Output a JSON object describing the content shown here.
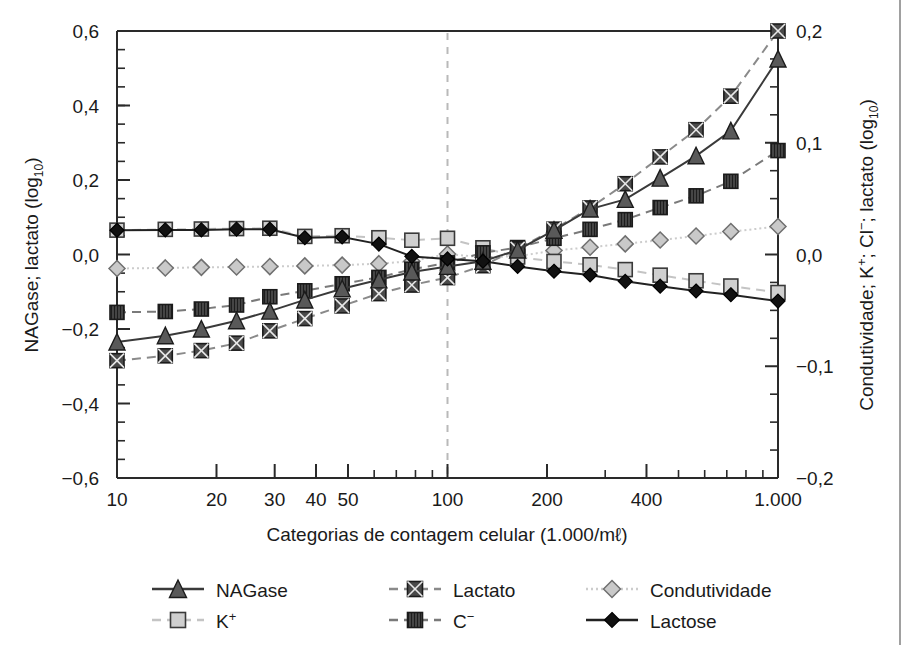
{
  "figure": {
    "background_color": "#ffffff",
    "frame_color": "#1a1a1a",
    "axis_color": "#2a2a2a",
    "right_border_x_note": "vertical rule near right edge of page"
  },
  "chart_data": {
    "type": "line",
    "title": "",
    "xlabel": "Categorias de contagem celular (1.000/mℓ)",
    "ylabel_left": "NAGase; lactato (log10)",
    "ylabel_right": "Condutividade; K+; Cl-; lactato (log10)",
    "xscale": "log",
    "xlim": [
      10,
      1000
    ],
    "xticks_major": [
      10,
      20,
      30,
      40,
      50,
      100,
      200,
      400,
      1000
    ],
    "xticklabels": [
      "10",
      "20",
      "30",
      "40",
      "50",
      "100",
      "200",
      "400",
      "1.000"
    ],
    "ylim_left": [
      -0.6,
      0.6
    ],
    "yticks_left": [
      -0.6,
      -0.4,
      -0.2,
      0.0,
      0.2,
      0.4,
      0.6
    ],
    "yticklabels_left": [
      "−0,6",
      "−0,4",
      "−0,2",
      "0,0",
      "0,2",
      "0,4",
      "0,6"
    ],
    "ylim_right": [
      -0.2,
      0.2
    ],
    "yticks_right": [
      -0.2,
      -0.1,
      0.0,
      0.1,
      0.2
    ],
    "yticklabels_right": [
      "−0,2",
      "−0,1",
      "0,0",
      "0,1",
      "0,2"
    ],
    "grid": false,
    "reference_line": {
      "x": 100,
      "style": "dashed",
      "color": "#b9b9b9"
    },
    "legend_position": "below-axes",
    "x": [
      10,
      14,
      18,
      23,
      29,
      37,
      48,
      62,
      78,
      100,
      128,
      163,
      210,
      270,
      345,
      440,
      565,
      720,
      1000
    ],
    "series": [
      {
        "name": "NAGase",
        "axis": "left",
        "marker": "triangle",
        "marker_fill": "#595959",
        "line_style": "solid",
        "line_color": "#3a3a3a",
        "values": [
          -0.235,
          -0.218,
          -0.2,
          -0.178,
          -0.152,
          -0.122,
          -0.092,
          -0.068,
          -0.047,
          -0.032,
          -0.018,
          0.012,
          0.065,
          0.122,
          0.148,
          0.205,
          0.265,
          0.332,
          0.525
        ]
      },
      {
        "name": "Lactato",
        "axis": "left",
        "marker": "square-x",
        "marker_fill": "#4a4a4a",
        "line_style": "dashed",
        "line_color": "#8a8a8a",
        "values": [
          -0.285,
          -0.272,
          -0.258,
          -0.238,
          -0.205,
          -0.172,
          -0.138,
          -0.105,
          -0.082,
          -0.062,
          -0.03,
          0.015,
          0.068,
          0.125,
          0.19,
          0.262,
          0.335,
          0.425,
          0.6
        ]
      },
      {
        "name": "Condutividade",
        "axis": "right",
        "marker": "diamond",
        "marker_fill": "#c9c9c9",
        "line_style": "dotted",
        "line_color": "#cccccc",
        "values": [
          -0.0125,
          -0.012,
          -0.0115,
          -0.0112,
          -0.0108,
          -0.0102,
          -0.0095,
          -0.0082,
          -0.006,
          0.0005,
          -0.0025,
          -0.0015,
          0.0035,
          0.0065,
          0.0095,
          0.013,
          0.0165,
          0.0205,
          0.025
        ]
      },
      {
        "name": "K+",
        "axis": "right",
        "marker": "square",
        "marker_fill": "#cfcfcf",
        "line_style": "dashed",
        "line_color": "#c4c4c4",
        "values": [
          0.0218,
          0.0225,
          0.0228,
          0.0232,
          0.0235,
          0.0162,
          0.0168,
          0.015,
          0.0128,
          0.0145,
          0.006,
          -0.0022,
          -0.0062,
          -0.0092,
          -0.0135,
          -0.0185,
          -0.0235,
          -0.0282,
          -0.034
        ]
      },
      {
        "name": "C−",
        "axis": "right",
        "marker": "square-hatch",
        "marker_fill": "#454545",
        "line_style": "dashed",
        "line_color": "#7a7a7a",
        "values": [
          -0.0518,
          -0.051,
          -0.0488,
          -0.0452,
          -0.0378,
          -0.0325,
          -0.0262,
          -0.0205,
          -0.0132,
          -0.0075,
          0.0015,
          0.0062,
          0.0145,
          0.0225,
          0.0312,
          0.042,
          0.0525,
          0.0655,
          0.093
        ]
      },
      {
        "name": "Lactose",
        "axis": "left",
        "marker": "diamond-filled",
        "marker_fill": "#111111",
        "line_style": "solid",
        "line_color": "#222222",
        "values": [
          0.065,
          0.066,
          0.066,
          0.068,
          0.068,
          0.045,
          0.047,
          0.028,
          -0.005,
          -0.012,
          -0.018,
          -0.032,
          -0.045,
          -0.055,
          -0.072,
          -0.085,
          -0.098,
          -0.108,
          -0.125
        ]
      }
    ]
  },
  "legend": {
    "items": [
      {
        "label": "NAGase",
        "marker": "triangle",
        "line_style": "solid",
        "marker_fill": "#595959",
        "line_color": "#3a3a3a"
      },
      {
        "label": "Lactato",
        "marker": "square-x",
        "line_style": "dashed",
        "marker_fill": "#4a4a4a",
        "line_color": "#8a8a8a"
      },
      {
        "label": "Condutividade",
        "marker": "diamond",
        "line_style": "dotted",
        "marker_fill": "#c9c9c9",
        "line_color": "#cccccc"
      },
      {
        "label": "K+",
        "marker": "square",
        "line_style": "dashed",
        "marker_fill": "#cfcfcf",
        "line_color": "#c4c4c4"
      },
      {
        "label": "C−",
        "marker": "square-hatch",
        "line_style": "dashed",
        "marker_fill": "#454545",
        "line_color": "#7a7a7a"
      },
      {
        "label": "Lactose",
        "marker": "diamond-filled",
        "line_style": "solid",
        "marker_fill": "#111111",
        "line_color": "#222222"
      }
    ],
    "k_label_base": "K",
    "k_label_sup": "+",
    "c_label_base": "C",
    "c_label_sup": "−"
  },
  "axis_labels": {
    "left_base": "NAGase; lactato (log",
    "left_sub": "10",
    "left_close": ")",
    "right_seg1": "Condutividade; K",
    "right_sup1": "+",
    "right_seg2": "; Cl",
    "right_sup2": "−",
    "right_seg3": "; lactato (log",
    "right_sub": "10",
    "right_close": ")",
    "x_label": "Categorias de contagem celular (1.000/mℓ)"
  }
}
